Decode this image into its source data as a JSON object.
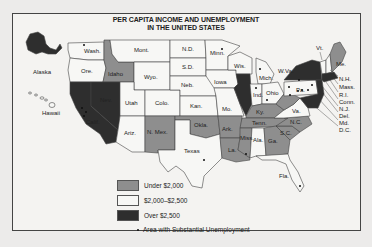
{
  "map": {
    "title_line1": "PER CAPITA INCOME AND UNEMPLOYMENT",
    "title_line2": "IN THE UNITED STATES",
    "colors": {
      "under_2000": "#8e8e8e",
      "range_2000_2500": "#f7f7f5",
      "over_2500": "#2e2e2e",
      "border": "#444444"
    },
    "legend": {
      "items": [
        {
          "label": "Under $2,000",
          "category": "under_2000"
        },
        {
          "label": "$2,000–$2,500",
          "category": "range_2000_2500"
        },
        {
          "label": "Over $2,500",
          "category": "over_2500"
        }
      ],
      "dot_label": "Area with Substantial Unemployment"
    },
    "states": {
      "under_2000": [
        "Idaho",
        "N. Mex.",
        "Okla.",
        "Ark.",
        "La.",
        "Miss.",
        "Ala.?",
        "Ga.",
        "S.C.",
        "N.C.",
        "Tenn.",
        "Ky.",
        "W.Va.",
        "Va.",
        "Me."
      ],
      "range_2000_2500": [
        "Wash.",
        "Ore.",
        "Mont.",
        "Wyo.",
        "Utah",
        "Colo.",
        "Ariz.",
        "N.D.",
        "S.D.",
        "Neb.",
        "Kan.",
        "Texas",
        "Minn.",
        "Iowa",
        "Mo.",
        "Wis.",
        "Mich.",
        "Ind.",
        "Ohio",
        "Ala.",
        "Fla.",
        "Vt.",
        "N.H."
      ],
      "over_2500": [
        "Alaska",
        "Nev.",
        "Calif.",
        "Ill.",
        "N.Y.",
        "Pa.?",
        "Mass.",
        "R.I.",
        "Conn.",
        "N.J.",
        "Del.",
        "Md.",
        "D.C."
      ]
    },
    "labels": {
      "alaska": "Alaska",
      "hawaii": "Hawaii",
      "wash": "Wash.",
      "ore": "Ore.",
      "idaho": "Idaho",
      "mont": "Mont.",
      "wyo": "Wyo.",
      "nev": "Nev.",
      "utah": "Utah",
      "colo": "Colo.",
      "calif": "Calif.",
      "ariz": "Ariz.",
      "nmex": "N. Mex.",
      "nd": "N.D.",
      "sd": "S.D.",
      "neb": "Neb.",
      "kan": "Kan.",
      "okla": "Okla.",
      "texas": "Texas",
      "minn": "Minn.",
      "iowa": "Iowa",
      "mo": "Mo.",
      "ark": "Ark.",
      "la": "La.",
      "wis": "Wis.",
      "mich": "Mich.",
      "ind": "Ind.",
      "ohio": "Ohio",
      "ky": "Ky.",
      "tenn": "Tenn.",
      "miss": "Miss.",
      "ala": "Ala.",
      "ga": "Ga.",
      "fla": "Fla.",
      "sc": "S.C.",
      "nc": "N.C.",
      "va": "Va.",
      "wva": "W.Va.",
      "pa": "Pa.",
      "vt": "Vt.",
      "me": "Me.",
      "nh": "N.H.",
      "mass": "Mass.",
      "ri": "R.I.",
      "conn": "Conn.",
      "nj": "N.J.",
      "del": "Del.",
      "md": "Md.",
      "dc": "D.C."
    }
  }
}
